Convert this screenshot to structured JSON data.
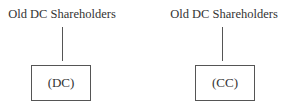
{
  "diagram": {
    "left": {
      "top_label": "Old DC Shareholders",
      "box_label": "(DC)"
    },
    "right": {
      "top_label": "Old DC Shareholders",
      "box_label": "(CC)"
    },
    "colors": {
      "line": "#555555",
      "text": "#333333",
      "background": "#ffffff"
    }
  }
}
